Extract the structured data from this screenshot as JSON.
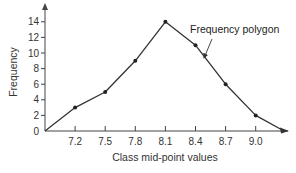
{
  "chart_data": {
    "type": "line",
    "title": "",
    "xlabel": "Class mid-point values",
    "ylabel": "Frequency",
    "x_tick_labels": [
      "7.2",
      "7.5",
      "7.8",
      "8.1",
      "8.4",
      "8.7",
      "9.0"
    ],
    "y_tick_labels": [
      "0",
      "2",
      "4",
      "6",
      "8",
      "10",
      "12",
      "14"
    ],
    "ylim": [
      0,
      15
    ],
    "grid": false,
    "legend": null,
    "series": [
      {
        "name": "Frequency polygon",
        "x": [
          6.9,
          7.2,
          7.5,
          7.8,
          8.1,
          8.4,
          8.7,
          9.0,
          9.3
        ],
        "values": [
          0,
          3,
          5,
          9,
          14,
          11,
          6,
          2,
          0
        ],
        "markers_at": [
          7.2,
          7.5,
          7.8,
          8.1,
          8.4,
          8.7,
          9.0
        ]
      }
    ],
    "annotations": [
      {
        "text": "Frequency polygon",
        "points_to": "segment between 8.4 and 8.7"
      }
    ]
  },
  "labels": {
    "xlabel": "Class mid-point values",
    "ylabel": "Frequency",
    "annotation": "Frequency polygon",
    "x_ticks": [
      "7.2",
      "7.5",
      "7.8",
      "8.1",
      "8.4",
      "8.7",
      "9.0"
    ],
    "y_ticks": [
      "0",
      "2",
      "4",
      "6",
      "8",
      "10",
      "12",
      "14"
    ]
  },
  "colors": {
    "line": "#333333",
    "axis": "#444444",
    "marker": "#222222"
  }
}
